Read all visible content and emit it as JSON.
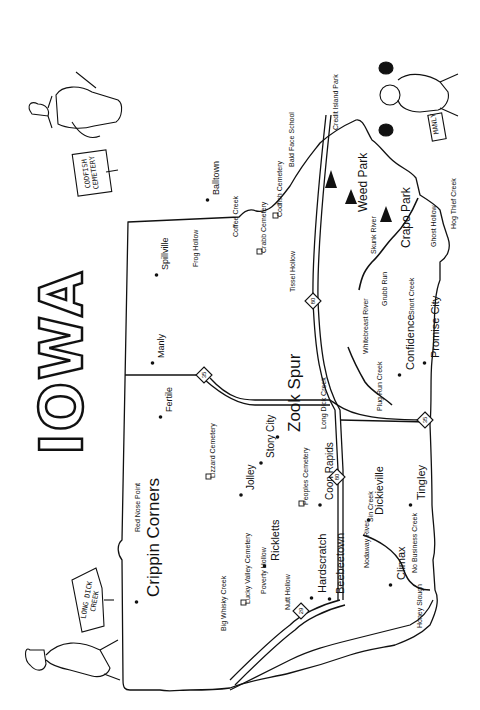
{
  "title": "IOWA",
  "orientation": "rotated 90 degrees counterclockwise",
  "signs": {
    "codfish": "CODFISH CEMETERY",
    "manly": "MANLY",
    "long_dick": "LONG DICK CREEK"
  },
  "highways": [
    {
      "number": "80",
      "x": 313,
      "y": 301
    },
    {
      "number": "35",
      "x": 204,
      "y": 375
    },
    {
      "number": "35",
      "x": 425,
      "y": 420
    },
    {
      "number": "80",
      "x": 337,
      "y": 477
    },
    {
      "number": "29",
      "x": 301,
      "y": 611
    }
  ],
  "places": [
    {
      "name": "Balltown",
      "x": 212,
      "y": 195,
      "size": 9,
      "type": "town"
    },
    {
      "name": "Bald Face School",
      "x": 288,
      "y": 167,
      "size": 7,
      "type": "school"
    },
    {
      "name": "Credit Island Park",
      "x": 332,
      "y": 130,
      "size": 7,
      "type": "park"
    },
    {
      "name": "Weed Park",
      "x": 357,
      "y": 212,
      "size": 12,
      "type": "park"
    },
    {
      "name": "Crapo Park",
      "x": 400,
      "y": 248,
      "size": 12,
      "type": "park"
    },
    {
      "name": "Hog Thief Creek",
      "x": 450,
      "y": 229,
      "size": 7,
      "type": "creek"
    },
    {
      "name": "Ghost Hollow",
      "x": 430,
      "y": 247,
      "size": 7,
      "type": "hollow"
    },
    {
      "name": "Skunk River",
      "x": 370,
      "y": 254,
      "size": 7,
      "type": "river"
    },
    {
      "name": "Grubb Run",
      "x": 381,
      "y": 306,
      "size": 7,
      "type": "creek"
    },
    {
      "name": "Snort Creek",
      "x": 408,
      "y": 315,
      "size": 7,
      "type": "creek"
    },
    {
      "name": "Promise City",
      "x": 430,
      "y": 358,
      "size": 11,
      "type": "town"
    },
    {
      "name": "Confidence",
      "x": 405,
      "y": 370,
      "size": 11,
      "type": "town"
    },
    {
      "name": "Whitebreast River",
      "x": 362,
      "y": 354,
      "size": 7,
      "type": "river"
    },
    {
      "name": "Plug Run Creek",
      "x": 376,
      "y": 411,
      "size": 7,
      "type": "creek"
    },
    {
      "name": "Spillville",
      "x": 161,
      "y": 270,
      "size": 9,
      "type": "town"
    },
    {
      "name": "Frog Hollow",
      "x": 192,
      "y": 267,
      "size": 7,
      "type": "hollow"
    },
    {
      "name": "Coffee Creek",
      "x": 232,
      "y": 237,
      "size": 7,
      "type": "creek"
    },
    {
      "name": "Crabb Cemetery",
      "x": 260,
      "y": 253,
      "size": 7,
      "type": "cemetery"
    },
    {
      "name": "Codfish Cemetery",
      "x": 276,
      "y": 217,
      "size": 7,
      "type": "cemetery"
    },
    {
      "name": "Tissel Hollow",
      "x": 289,
      "y": 292,
      "size": 7,
      "type": "hollow"
    },
    {
      "name": "Manly",
      "x": 157,
      "y": 358,
      "size": 9,
      "type": "town"
    },
    {
      "name": "Fertile",
      "x": 165,
      "y": 412,
      "size": 9,
      "type": "town"
    },
    {
      "name": "Long Dick Creek",
      "x": 320,
      "y": 429,
      "size": 7,
      "type": "creek"
    },
    {
      "name": "Zook Spur",
      "x": 286,
      "y": 432,
      "size": 17,
      "type": "town"
    },
    {
      "name": "Story City",
      "x": 266,
      "y": 458,
      "size": 10,
      "type": "town"
    },
    {
      "name": "Lizzard Cemetery",
      "x": 209,
      "y": 478,
      "size": 7,
      "type": "cemetery"
    },
    {
      "name": "Jolley",
      "x": 246,
      "y": 490,
      "size": 10,
      "type": "town"
    },
    {
      "name": "Peoples Cemetery",
      "x": 302,
      "y": 505,
      "size": 7,
      "type": "cemetery"
    },
    {
      "name": "Coon Rapids",
      "x": 325,
      "y": 500,
      "size": 10,
      "type": "town"
    },
    {
      "name": "Dickieville",
      "x": 374,
      "y": 515,
      "size": 11,
      "type": "town"
    },
    {
      "name": "Tingley",
      "x": 416,
      "y": 500,
      "size": 11,
      "type": "town"
    },
    {
      "name": "Red Nose Point",
      "x": 134,
      "y": 532,
      "size": 7,
      "type": "point"
    },
    {
      "name": "Crippin Corners",
      "x": 145,
      "y": 597,
      "size": 17,
      "type": "town"
    },
    {
      "name": "Lucky Valley Cemetery",
      "x": 244,
      "y": 604,
      "size": 7,
      "type": "cemetery"
    },
    {
      "name": "Rickletts",
      "x": 270,
      "y": 561,
      "size": 11,
      "type": "town"
    },
    {
      "name": "Poverty Hollow",
      "x": 260,
      "y": 594,
      "size": 7,
      "type": "hollow"
    },
    {
      "name": "Nutt Hollow",
      "x": 284,
      "y": 610,
      "size": 7,
      "type": "hollow"
    },
    {
      "name": "Hardscratch",
      "x": 317,
      "y": 593,
      "size": 11,
      "type": "town"
    },
    {
      "name": "Beebeetown",
      "x": 335,
      "y": 594,
      "size": 11,
      "type": "town"
    },
    {
      "name": "Sin Creek",
      "x": 367,
      "y": 522,
      "size": 7,
      "type": "creek"
    },
    {
      "name": "Nodaway River",
      "x": 363,
      "y": 568,
      "size": 7,
      "type": "river"
    },
    {
      "name": "Climax",
      "x": 396,
      "y": 580,
      "size": 11,
      "type": "town"
    },
    {
      "name": "No Business Creek",
      "x": 411,
      "y": 573,
      "size": 7,
      "type": "creek"
    },
    {
      "name": "Honey Slough",
      "x": 416,
      "y": 628,
      "size": 7,
      "type": "slough"
    },
    {
      "name": "Big Whisky Creek",
      "x": 220,
      "y": 631,
      "size": 7,
      "type": "creek"
    }
  ]
}
